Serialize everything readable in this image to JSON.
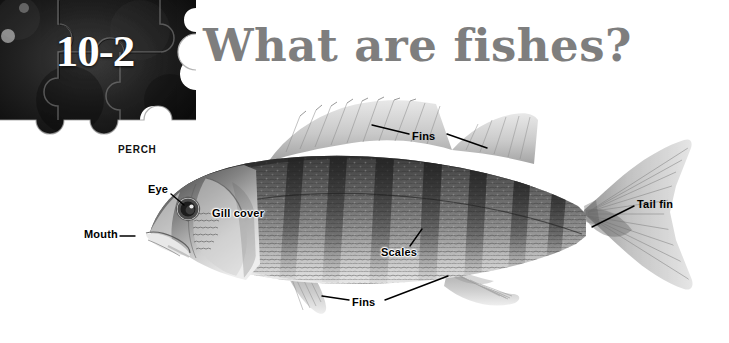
{
  "page": {
    "background_color": "#ffffff",
    "width": 729,
    "height": 343
  },
  "header": {
    "section_number": "10-2",
    "title": "What are fishes?",
    "title_color": "#7e7e7e",
    "puzzle_block_color": "#1a1a1a",
    "puzzle_block_label": "puzzle-piece-header"
  },
  "figure": {
    "specimen_caption": "PERCH",
    "photo_style": "grayscale",
    "callouts": [
      {
        "id": "fins_top",
        "label": "Fins",
        "leader": "two-lines-to-dorsal-fins"
      },
      {
        "id": "tail_fin",
        "label": "Tail fin",
        "leader": "line-down-left-to-caudal-fin"
      },
      {
        "id": "eye",
        "label": "Eye",
        "leader": "curved-line-down-right-to-eye"
      },
      {
        "id": "gill_cover",
        "label": "Gill cover",
        "leader": "none"
      },
      {
        "id": "mouth",
        "label": "Mouth",
        "leader": "short-dash-right"
      },
      {
        "id": "scales",
        "label": "Scales",
        "leader": "short-line-up-right"
      },
      {
        "id": "fins_bottom",
        "label": "Fins",
        "leader": "two-lines-to-pelvic-and-anal-fins"
      }
    ]
  }
}
